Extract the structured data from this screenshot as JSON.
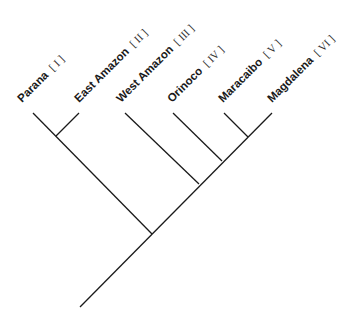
{
  "diagram": {
    "type": "cladogram",
    "colors": {
      "line": "#1a1a1a",
      "text": "#1a1a1a",
      "background": "#ffffff"
    },
    "taxa": [
      {
        "name": "Parana",
        "numeral": "[ I ]"
      },
      {
        "name": "East Amazon",
        "numeral": "[ II ]"
      },
      {
        "name": "West Amazon",
        "numeral": "[ III ]"
      },
      {
        "name": "Orinoco",
        "numeral": "[ IV ]"
      },
      {
        "name": "Maracaibo",
        "numeral": "[ V ]"
      },
      {
        "name": "Magdalena",
        "numeral": "[ VI ]"
      }
    ],
    "topology": "((Parana, East Amazon), (West Amazon, (Orinoco, (Maracaibo, Magdalena))))"
  }
}
